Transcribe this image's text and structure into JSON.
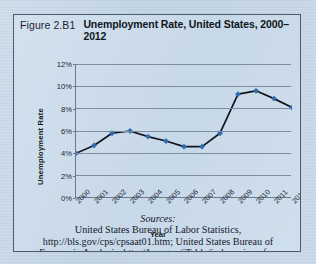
{
  "figure": {
    "number": "Figure 2.B1",
    "title": "Unemployment Rate, United States, 2000–2012"
  },
  "sources": {
    "label": "Sources:",
    "line1": "United States Bureau of Labor Statistics,",
    "line2": "http://bls.gov/cps/cpsaat01.htm; United States Bureau of",
    "line3": "Economic Analysis, http://bea.gov/iTable/index_nipa.cfm."
  },
  "chart_data": {
    "type": "line",
    "title": "Unemployment Rate, United States, 2000–2012",
    "xlabel": "Year",
    "ylabel": "Unemployment Rate",
    "categories": [
      "2000",
      "2001",
      "2002",
      "2003",
      "2004",
      "2005",
      "2006",
      "2007",
      "2008",
      "2009",
      "2010",
      "2011",
      "2012"
    ],
    "values": [
      4.0,
      4.7,
      5.8,
      6.0,
      5.5,
      5.1,
      4.6,
      4.6,
      5.8,
      9.3,
      9.6,
      8.9,
      8.1
    ],
    "ylim": [
      0,
      12
    ],
    "ytick_labels": [
      "0%",
      "2%",
      "4%",
      "6%",
      "8%",
      "10%",
      "12%"
    ],
    "ytick_values": [
      0,
      2,
      4,
      6,
      8,
      10,
      12
    ],
    "grid": true,
    "legend": "none",
    "series_color": "#2f6bb0",
    "line_color": "#11161c",
    "marker": "diamond"
  },
  "colors": {
    "page_background": "#c4d6e6",
    "figure_background": "#ccdbea",
    "border": "#4a5b70",
    "accent": "#2f6bb0",
    "text": "#14202c"
  }
}
